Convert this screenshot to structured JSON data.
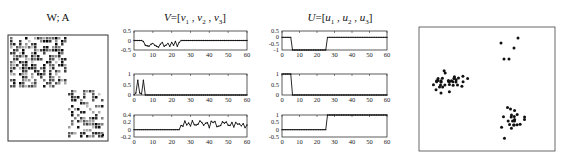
{
  "panels": {
    "matrix": {
      "title": "W;  A"
    },
    "v": {
      "title": "V=[v1 , v2 , v3]"
    },
    "u": {
      "title": "U=[u1 , u2 , u3]"
    }
  },
  "chart_data": [
    {
      "type": "heatmap",
      "title": "W; A",
      "description": "Block-diagonal sparse affinity matrix: large block top-left (~rows 1-25), smaller block bottom-right (~rows 26-60)"
    },
    {
      "type": "line",
      "title": "V=[v1, v2, v3]",
      "x": [
        0,
        60
      ],
      "subplots": [
        {
          "name": "v1",
          "ylim": [
            -0.5,
            0.5
          ],
          "yticks": [
            "0.5",
            "0",
            "-0.5"
          ],
          "xticks": [
            "0",
            "10",
            "20",
            "30",
            "40",
            "50",
            "60"
          ],
          "description": "≈0 for x 0-5, fluctuates between -0.35 and -0.1 for x 5-25, ≈0 for x 25-60"
        },
        {
          "name": "v2",
          "ylim": [
            0,
            1
          ],
          "yticks": [
            "1",
            "0.5",
            "0"
          ],
          "xticks": [
            "0",
            "10",
            "20",
            "30",
            "40",
            "50",
            "60"
          ],
          "description": "two spikes to ~0.7 at x≈2 and x≈5, ≈0 elsewhere"
        },
        {
          "name": "v3",
          "ylim": [
            -0.2,
            0.4
          ],
          "yticks": [
            "0.4",
            "0.2",
            "0",
            "-0.2"
          ],
          "xticks": [
            "0",
            "10",
            "20",
            "30",
            "40",
            "50",
            "60"
          ],
          "description": "≈0 for x 0-25, fluctuates 0.05-0.25 for x 25-60"
        }
      ]
    },
    {
      "type": "line",
      "title": "U=[u1, u2, u3]",
      "subplots": [
        {
          "name": "u1",
          "ylim": [
            -1,
            0.5
          ],
          "yticks": [
            "0.5",
            "0",
            "-0.5",
            "-1"
          ],
          "xticks": [
            "0",
            "10",
            "20",
            "30",
            "40",
            "50",
            "60"
          ],
          "description": "0 for x 0-5, -1 for x 6-25, 0 for x 26-60"
        },
        {
          "name": "u2",
          "ylim": [
            0,
            1
          ],
          "yticks": [
            "1",
            "0.5",
            "0"
          ],
          "xticks": [
            "0",
            "10",
            "20",
            "30",
            "40",
            "50",
            "60"
          ],
          "description": "1 for x 0-5, 0 for x 6-60"
        },
        {
          "name": "u3",
          "ylim": [
            -0.5,
            1
          ],
          "yticks": [
            "1",
            "0.5",
            "0",
            "-0.5"
          ],
          "xticks": [
            "0",
            "10",
            "20",
            "30",
            "40",
            "50",
            "60"
          ],
          "description": "0 for x 0-25, 1 for x 26-60"
        }
      ]
    },
    {
      "type": "scatter",
      "title": "",
      "description": "Three clusters: large cluster left-center (~35 pts), small cluster top-right (~5 pts), medium cluster bottom-right (~20 pts)"
    }
  ]
}
